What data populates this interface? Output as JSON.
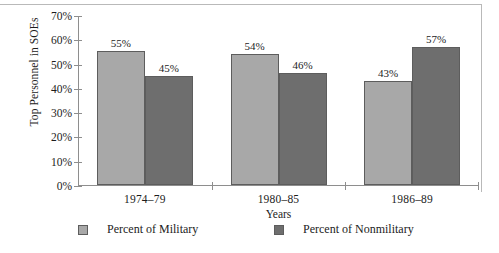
{
  "chart_data": {
    "type": "bar",
    "title": "",
    "xlabel": "Years",
    "ylabel": "Top Personnel in SOEs",
    "categories": [
      "1974–79",
      "1980–85",
      "1986–89"
    ],
    "series": [
      {
        "name": "Percent of Military",
        "color": "#a8a8a8",
        "values": [
          55,
          54,
          43
        ],
        "labels": [
          "55%",
          "54%",
          "43%"
        ]
      },
      {
        "name": "Percent of Nonmilitary",
        "color": "#6e6e6e",
        "values": [
          45,
          46,
          57
        ],
        "labels": [
          "45%",
          "46%",
          "57%"
        ]
      }
    ],
    "ylim": [
      0,
      70
    ],
    "ytick_values": [
      0,
      10,
      20,
      30,
      40,
      50,
      60,
      70
    ],
    "ytick_labels": [
      "0%",
      "10%",
      "20%",
      "30%",
      "40%",
      "50%",
      "60%",
      "70%"
    ],
    "grid": false,
    "legend_position": "bottom",
    "bar_value_labels_shown": true
  }
}
